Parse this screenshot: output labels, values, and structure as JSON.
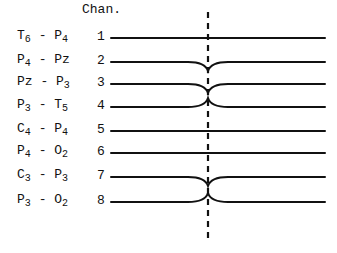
{
  "diagram": {
    "header": "Chan.",
    "channels": [
      {
        "number": "1",
        "a": "T",
        "a_sub": "6",
        "b": "P",
        "b_sub": "4",
        "deflection": "none"
      },
      {
        "number": "2",
        "a": "P",
        "a_sub": "4",
        "b": "Pz",
        "b_sub": "",
        "deflection": "down"
      },
      {
        "number": "3",
        "a": "Pz",
        "a_sub": "",
        "b": "P",
        "b_sub": "3",
        "deflection": "down"
      },
      {
        "number": "4",
        "a": "P",
        "a_sub": "3",
        "b": "T",
        "b_sub": "5",
        "deflection": "up"
      },
      {
        "number": "5",
        "a": "C",
        "a_sub": "4",
        "b": "P",
        "b_sub": "4",
        "deflection": "none"
      },
      {
        "number": "6",
        "a": "P",
        "a_sub": "4",
        "b": "O",
        "b_sub": "2",
        "deflection": "none"
      },
      {
        "number": "7",
        "a": "C",
        "a_sub": "3",
        "b": "P",
        "b_sub": "3",
        "deflection": "down"
      },
      {
        "number": "8",
        "a": "P",
        "a_sub": "3",
        "b": "O",
        "b_sub": "2",
        "deflection": "up"
      }
    ],
    "separator": " - ",
    "marker": "dashed vertical line at event time"
  }
}
